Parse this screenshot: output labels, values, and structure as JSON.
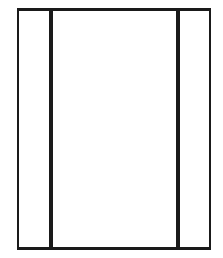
{
  "diagram": {
    "type": "three-panel-frame",
    "stroke_color": "#1a1a1a",
    "background_color": "#ffffff",
    "outer_frame": {
      "left": 17,
      "top": 8,
      "right": 211,
      "bottom": 250,
      "border_top": 3,
      "border_bottom": 3,
      "border_left": 2,
      "border_right": 2
    },
    "panels": [
      {
        "name": "left-panel",
        "x_start": 19,
        "x_end": 49
      },
      {
        "name": "center-panel",
        "x_start": 53,
        "x_end": 176
      },
      {
        "name": "right-panel",
        "x_start": 180,
        "x_end": 209
      }
    ],
    "dividers": [
      {
        "name": "left-divider",
        "x": 49,
        "width": 4
      },
      {
        "name": "right-divider",
        "x": 176,
        "width": 4
      }
    ]
  }
}
